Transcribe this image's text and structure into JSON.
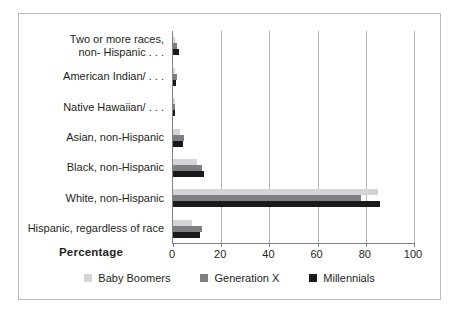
{
  "chart_data": {
    "type": "bar",
    "orientation": "horizontal",
    "title": "",
    "xlabel": "Percentage",
    "ylabel": "",
    "xlim": [
      0,
      100
    ],
    "xticks": [
      0,
      20,
      40,
      60,
      80,
      100
    ],
    "grid": true,
    "legend_position": "bottom",
    "categories": [
      "Two or more races,\nnon- Hispanic . . .",
      "American Indian/ . . .",
      "Native Hawaiian/ . . .",
      "Asian, non-Hispanic",
      "Black, non-Hispanic",
      "White, non-Hispanic",
      "Hispanic, regardless of race"
    ],
    "series": [
      {
        "name": "Baby Boomers",
        "color": "#d3d4d5",
        "values": [
          1.0,
          1.0,
          0.5,
          3.0,
          10.0,
          85.0,
          8.0
        ]
      },
      {
        "name": "Generation X",
        "color": "#7d7f82",
        "values": [
          1.5,
          1.5,
          0.8,
          4.5,
          12.0,
          78.0,
          12.0
        ]
      },
      {
        "name": "Millennials",
        "color": "#1a1a1a",
        "values": [
          2.5,
          1.2,
          1.0,
          4.0,
          13.0,
          86.0,
          11.0
        ]
      }
    ]
  },
  "axis": {
    "x_title": "Percentage",
    "tick_labels": [
      "0",
      "20",
      "40",
      "60",
      "80",
      "100"
    ]
  },
  "legend": {
    "items": [
      {
        "label": "Baby Boomers",
        "color": "#d3d4d5"
      },
      {
        "label": "Generation X",
        "color": "#7d7f82"
      },
      {
        "label": "Millennials",
        "color": "#1a1a1a"
      }
    ]
  }
}
